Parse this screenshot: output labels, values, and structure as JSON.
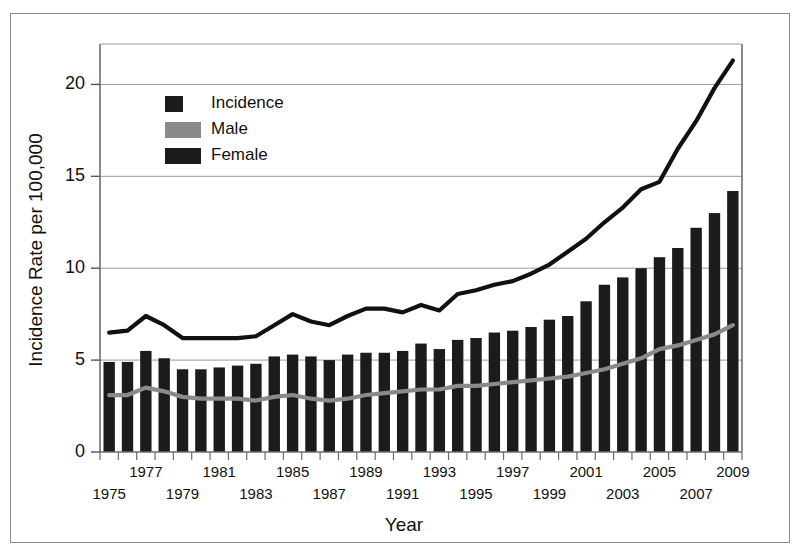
{
  "chart_data": {
    "type": "bar",
    "title": "",
    "xlabel": "Year",
    "ylabel": "Incidence Rate per 100,000",
    "ylim": [
      0,
      22.2
    ],
    "yticks": [
      0,
      5,
      10,
      15,
      20
    ],
    "ytick_labels": [
      "0",
      "5",
      "10",
      "15",
      "20"
    ],
    "grid": true,
    "legend_position": "upper-left-inside",
    "categories": [
      1975,
      1976,
      1977,
      1978,
      1979,
      1980,
      1981,
      1982,
      1983,
      1984,
      1985,
      1986,
      1987,
      1988,
      1989,
      1990,
      1991,
      1992,
      1993,
      1994,
      1995,
      1996,
      1997,
      1998,
      1999,
      2000,
      2001,
      2002,
      2003,
      2004,
      2005,
      2006,
      2007,
      2008,
      2009
    ],
    "xtick_labels_upper": [
      "1977",
      "1981",
      "1985",
      "1989",
      "1993",
      "1997",
      "2001",
      "2005",
      "2009"
    ],
    "xtick_labels_lower": [
      "1975",
      "1979",
      "1983",
      "1987",
      "1991",
      "1995",
      "1999",
      "2003",
      "2007"
    ],
    "series": [
      {
        "name": "Incidence",
        "render": "line",
        "color": "#111111",
        "values": [
          6.5,
          6.6,
          7.4,
          6.9,
          6.2,
          6.2,
          6.2,
          6.2,
          6.3,
          6.9,
          7.5,
          7.1,
          6.9,
          7.4,
          7.8,
          7.8,
          7.6,
          8.0,
          7.7,
          8.6,
          8.8,
          9.1,
          9.3,
          9.7,
          10.2,
          10.9,
          11.6,
          12.5,
          13.3,
          14.3,
          14.7,
          16.5,
          18.0,
          19.8,
          21.3
        ]
      },
      {
        "name": "Male",
        "render": "line",
        "color": "#8a8a8a",
        "values": [
          3.1,
          3.1,
          3.5,
          3.3,
          3.0,
          2.9,
          2.9,
          2.9,
          2.8,
          3.0,
          3.1,
          2.9,
          2.8,
          2.9,
          3.1,
          3.2,
          3.3,
          3.4,
          3.4,
          3.6,
          3.6,
          3.7,
          3.8,
          3.9,
          4.0,
          4.1,
          4.3,
          4.5,
          4.8,
          5.1,
          5.6,
          5.8,
          6.1,
          6.4,
          6.9
        ]
      },
      {
        "name": "Female",
        "render": "bar",
        "color": "#1b1b1b",
        "values": [
          4.9,
          4.9,
          5.5,
          5.1,
          4.5,
          4.5,
          4.6,
          4.7,
          4.8,
          5.2,
          5.3,
          5.2,
          5.0,
          5.3,
          5.4,
          5.4,
          5.5,
          5.9,
          5.6,
          6.1,
          6.2,
          6.5,
          6.6,
          6.8,
          7.2,
          7.4,
          8.2,
          9.1,
          9.5,
          10.0,
          10.6,
          11.1,
          12.2,
          13.0,
          14.2
        ]
      }
    ]
  },
  "legend": {
    "items": [
      {
        "label": "Incidence",
        "swatch": "square",
        "color": "#1b1b1b"
      },
      {
        "label": "Male",
        "swatch": "bar",
        "color": "#8a8a8a"
      },
      {
        "label": "Female",
        "swatch": "bar",
        "color": "#1b1b1b"
      }
    ]
  },
  "axes": {
    "y_title": "Incidence Rate per 100,000",
    "x_title": "Year"
  }
}
